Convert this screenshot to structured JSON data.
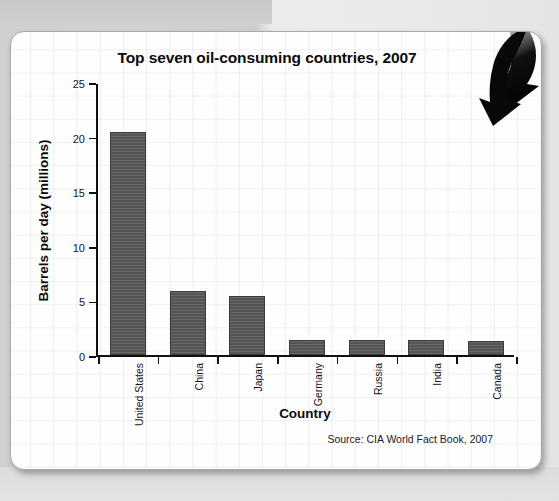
{
  "chart_data": {
    "type": "bar",
    "title": "Top seven oil-consuming countries, 2007",
    "xlabel": "Country",
    "ylabel": "Barrels per day (millions)",
    "categories": [
      "United States",
      "China",
      "Japan",
      "Germany",
      "Russia",
      "India",
      "Canada"
    ],
    "values": [
      20.4,
      5.9,
      5.4,
      1.4,
      1.35,
      1.35,
      1.25
    ],
    "ylim": [
      0,
      25
    ],
    "yticks": [
      0,
      5,
      10,
      15,
      20,
      25
    ],
    "ytick_labels": [
      "0",
      "5",
      "10",
      "15",
      "20",
      "25"
    ],
    "grid": "faint background graph-paper grid (not chart gridlines)",
    "legend": "none",
    "bar_color": "#595959",
    "bar_edge_color": "#3b3b3b",
    "source_note": "Source: CIA World Fact Book, 2007"
  },
  "page": {
    "background_color": "#d0d0d0",
    "card_color": "#fefefe",
    "card_border_color": "#a9a9a9"
  },
  "decorations": {
    "arrow": {
      "name": "curved-down-arrow",
      "color": "#101010",
      "description": "large curved black arrow pointing down into the top-right corner of the chart"
    }
  }
}
